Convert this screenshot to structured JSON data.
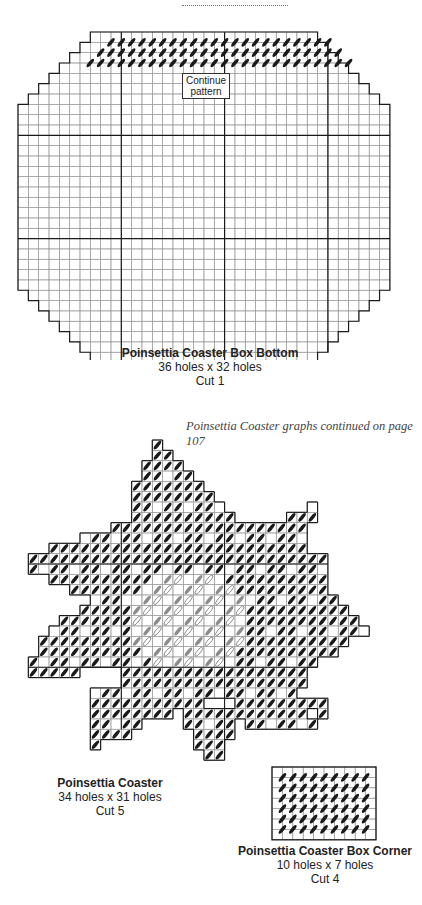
{
  "page": {
    "note": "Poinsettia Coaster graphs continued on page 107"
  },
  "colors": {
    "grid_line": "#9a9a9a",
    "heavy_line": "#1a1a1a",
    "stitch_dark": "#1a1a1a",
    "stitch_medium": "#8c8c8c",
    "stitch_light_outline": "#777777"
  },
  "box_bottom": {
    "title": "Poinsettia Coaster Box Bottom",
    "size": "36 holes x 32 holes",
    "cut": "Cut 1",
    "label": "Continue pattern",
    "label_line1": "Continue",
    "label_line2": "pattern",
    "cols": 36,
    "rows": 32,
    "origin": [
      18,
      32
    ],
    "cell": 10.33,
    "heavy_every": 10,
    "row_insets": [
      7,
      6,
      5,
      4,
      3,
      2,
      1,
      0,
      0,
      0,
      0,
      0,
      0,
      0,
      0,
      0,
      0,
      0,
      0,
      0,
      0,
      0,
      0,
      0,
      0,
      0,
      1,
      2,
      3,
      4,
      5,
      6,
      7
    ],
    "stitched_rows": [
      {
        "row": 1,
        "from": 8,
        "to": 30
      },
      {
        "row": 2,
        "from": 7,
        "to": 31
      },
      {
        "row": 3,
        "from": 6,
        "to": 32
      }
    ]
  },
  "coaster": {
    "title": "Poinsettia Coaster",
    "size": "34 holes x 31 holes",
    "cut": "Cut 5"
  },
  "box_corner": {
    "title": "Poinsettia Coaster Box Corner",
    "size": "10 holes x 7 holes",
    "cut": "Cut 4",
    "cols": 10,
    "rows": 7,
    "origin": [
      272,
      767
    ],
    "cell": 10.4
  }
}
